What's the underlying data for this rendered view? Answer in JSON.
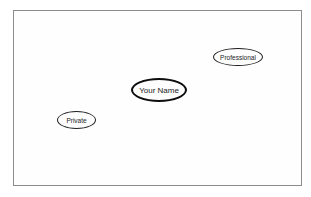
{
  "diagram": {
    "background_color": "#ffffff",
    "frame_border_color": "#8c8c8c",
    "node_border_color": "#1a1a1a",
    "nodes": [
      {
        "id": "professional",
        "label": "Professional",
        "emphasis": "normal",
        "position": "top-right"
      },
      {
        "id": "your-name",
        "label": "Your Name",
        "emphasis": "bold-outline",
        "position": "center"
      },
      {
        "id": "private",
        "label": "Private",
        "emphasis": "normal",
        "position": "bottom-left"
      }
    ]
  }
}
